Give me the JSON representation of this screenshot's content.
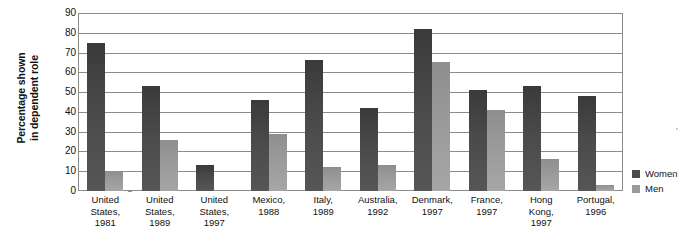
{
  "chart_data": {
    "type": "bar",
    "title": "",
    "xlabel": "",
    "ylabel": "Percentage shown in dependent role",
    "ylim": [
      0,
      90
    ],
    "yticks": [
      0,
      10,
      20,
      30,
      40,
      50,
      60,
      70,
      80,
      90
    ],
    "grid": true,
    "legend_position": "right",
    "categories": [
      "United States, 1981",
      "United States, 1989",
      "United States, 1997",
      "Mexico, 1988",
      "Italy, 1989",
      "Australia, 1992",
      "Denmark, 1997",
      "France, 1997",
      "Hong Kong, 1997",
      "Portugal, 1996"
    ],
    "category_lines": [
      [
        "United",
        "States,",
        "1981"
      ],
      [
        "United",
        "States,",
        "1989"
      ],
      [
        "United",
        "States,",
        "1997"
      ],
      [
        "Mexico,",
        "1988"
      ],
      [
        "Italy,",
        "1989"
      ],
      [
        "Australia,",
        "1992"
      ],
      [
        "Denmark,",
        "1997"
      ],
      [
        "France,",
        "1997"
      ],
      [
        "Hong",
        "Kong,",
        "1997"
      ],
      [
        "Portugal,",
        "1996"
      ]
    ],
    "series": [
      {
        "name": "Women",
        "color": "#4a4a4a",
        "values": [
          75,
          53,
          13,
          46,
          66,
          42,
          82,
          51,
          53,
          48
        ]
      },
      {
        "name": "Men",
        "color": "#9a9a9a",
        "values": [
          10,
          26,
          0,
          29,
          12,
          13,
          65,
          41,
          16,
          3
        ]
      }
    ]
  },
  "axis": {
    "y_title_line1": "Percentage shown",
    "y_title_line2": "in dependent role"
  },
  "legend": {
    "items": [
      {
        "label": "Women",
        "color": "#4a4a4a"
      },
      {
        "label": "Men",
        "color": "#9a9a9a"
      }
    ]
  }
}
